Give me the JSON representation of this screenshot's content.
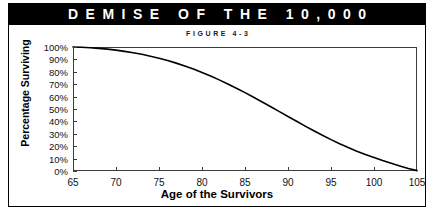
{
  "banner": {
    "title": "DEMISE OF THE 10,000",
    "background_color": "#000000",
    "text_color": "#ffffff"
  },
  "figure": {
    "subtitle": "FIGURE 4-3",
    "border_color": "#000000",
    "background_color": "#ffffff"
  },
  "chart_data": {
    "type": "line",
    "title": "DEMISE OF THE 10,000",
    "subtitle": "FIGURE 4-3",
    "xlabel": "Age of the Survivors",
    "ylabel": "Percentage Surviving",
    "xlim": [
      65,
      105
    ],
    "ylim": [
      0,
      100
    ],
    "xticks": [
      65,
      70,
      75,
      80,
      85,
      90,
      95,
      100,
      105
    ],
    "xtick_labels": [
      "65",
      "70",
      "75",
      "80",
      "85",
      "90",
      "95",
      "100",
      "105"
    ],
    "yticks": [
      0,
      10,
      20,
      30,
      40,
      50,
      60,
      70,
      80,
      90,
      100
    ],
    "ytick_labels": [
      "0%",
      "10%",
      "20%",
      "30%",
      "40%",
      "50%",
      "60%",
      "70%",
      "80%",
      "90%",
      "100%"
    ],
    "grid": false,
    "legend": null,
    "line_color": "#000000",
    "line_width": 1.6,
    "x": [
      65,
      66,
      67,
      68,
      69,
      70,
      71,
      72,
      73,
      74,
      75,
      76,
      77,
      78,
      79,
      80,
      81,
      82,
      83,
      84,
      85,
      86,
      87,
      88,
      89,
      90,
      91,
      92,
      93,
      94,
      95,
      96,
      97,
      98,
      99,
      100,
      101,
      102,
      103,
      104,
      105
    ],
    "values": [
      100,
      99.8,
      99.4,
      98.9,
      98.3,
      97.5,
      96.5,
      95.4,
      94.1,
      92.6,
      91.0,
      89.1,
      87.0,
      84.7,
      82.2,
      79.5,
      76.6,
      73.5,
      70.2,
      66.8,
      63.2,
      59.5,
      55.7,
      51.8,
      47.9,
      44.0,
      40.1,
      36.2,
      32.4,
      28.8,
      25.3,
      22.0,
      18.9,
      16.0,
      13.3,
      10.8,
      8.4,
      6.2,
      4.1,
      2.1,
      0.3
    ],
    "series": [
      {
        "name": "Percentage Surviving",
        "values": [
          100,
          99.8,
          99.4,
          98.9,
          98.3,
          97.5,
          96.5,
          95.4,
          94.1,
          92.6,
          91.0,
          89.1,
          87.0,
          84.7,
          82.2,
          79.5,
          76.6,
          73.5,
          70.2,
          66.8,
          63.2,
          59.5,
          55.7,
          51.8,
          47.9,
          44.0,
          40.1,
          36.2,
          32.4,
          28.8,
          25.3,
          22.0,
          18.9,
          16.0,
          13.3,
          10.8,
          8.4,
          6.2,
          4.1,
          2.1,
          0.3
        ]
      }
    ]
  }
}
